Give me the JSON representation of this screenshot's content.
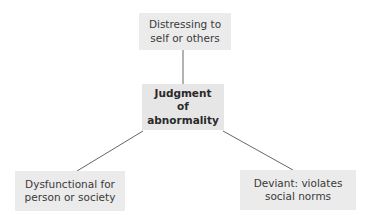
{
  "diagram": {
    "type": "concept-map",
    "center": {
      "label": "Judgment\nof\nabnormality"
    },
    "nodes": [
      {
        "id": "top",
        "label": "Distressing to\nself or others"
      },
      {
        "id": "left",
        "label": "Dysfunctional for\nperson or society"
      },
      {
        "id": "right",
        "label": "Deviant: violates\nsocial norms"
      }
    ],
    "edges": [
      {
        "from": "center",
        "to": "top"
      },
      {
        "from": "center",
        "to": "left"
      },
      {
        "from": "center",
        "to": "right"
      }
    ],
    "colors": {
      "box_fill": "#ebebeb",
      "line": "#666666",
      "text": "#3a3a3a"
    }
  }
}
